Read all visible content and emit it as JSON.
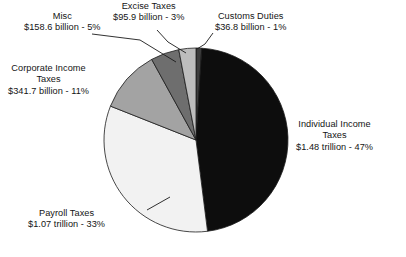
{
  "chart_data": {
    "type": "pie",
    "title": "",
    "categories": [
      "Customs Duties",
      "Individual Income Taxes",
      "Payroll Taxes",
      "Corporate Income Taxes",
      "Misc",
      "Excise Taxes"
    ],
    "values": [
      1,
      47,
      33,
      11,
      5,
      3
    ],
    "value_labels": [
      "$36.8 billion",
      "$1.48 trillion",
      "$1.07 trillion",
      "$341.7 billion",
      "$158.6 billion",
      "$95.9 billion"
    ],
    "percent_labels": [
      "1%",
      "47%",
      "33%",
      "11%",
      "5%",
      "3%"
    ],
    "colors": [
      "#3c3c3c",
      "#0d0d0d",
      "#f2f2f2",
      "#a3a3a3",
      "#6e6e6e",
      "#bdbdbd"
    ],
    "legend": "none",
    "grid": false,
    "start_angle_deg": 0,
    "direction": "clockwise",
    "slices": [
      {
        "name": "Customs Duties",
        "percent": 1,
        "amount": "$36.8 billion",
        "label_line1": "Customs Duties",
        "label_line2": "$36.8 billion - 1%",
        "color": "#3c3c3c"
      },
      {
        "name": "Individual Income Taxes",
        "percent": 47,
        "amount": "$1.48 trillion",
        "label_line1": "Individual Income",
        "label_line2": "Taxes",
        "label_line3": "$1.48 trillion - 47%",
        "color": "#0d0d0d"
      },
      {
        "name": "Payroll Taxes",
        "percent": 33,
        "amount": "$1.07 trillion",
        "label_line1": "Payroll Taxes",
        "label_line2": "$1.07 trillion - 33%",
        "color": "#f2f2f2"
      },
      {
        "name": "Corporate Income Taxes",
        "percent": 11,
        "amount": "$341.7 billion",
        "label_line1": "Corporate Income",
        "label_line2": "Taxes",
        "label_line3": "$341.7 billion - 11%",
        "color": "#a3a3a3"
      },
      {
        "name": "Misc",
        "percent": 5,
        "amount": "$158.6 billion",
        "label_line1": "Misc",
        "label_line2": "$158.6 billion - 5%",
        "color": "#6e6e6e"
      },
      {
        "name": "Excise Taxes",
        "percent": 3,
        "amount": "$95.9 billion",
        "label_line1": "Excise Taxes",
        "label_line2": "$95.9 billion - 3%",
        "color": "#bdbdbd"
      }
    ],
    "geometry": {
      "cx": 196,
      "cy": 140,
      "r": 92
    }
  },
  "labels": {
    "misc": {
      "l1": "Misc",
      "l2": "$158.6 billion - 5%"
    },
    "excise": {
      "l1": "Excise Taxes",
      "l2": "$95.9 billion - 3%"
    },
    "customs": {
      "l1": "Customs Duties",
      "l2": "$36.8 billion - 1%"
    },
    "corporate": {
      "l1": "Corporate Income",
      "l2": "Taxes",
      "l3": "$341.7 billion - 11%"
    },
    "individual": {
      "l1": "Individual Income",
      "l2": "Taxes",
      "l3": "$1.48 trillion - 47%"
    },
    "payroll": {
      "l1": "Payroll Taxes",
      "l2": "$1.07 trillion - 33%"
    }
  }
}
